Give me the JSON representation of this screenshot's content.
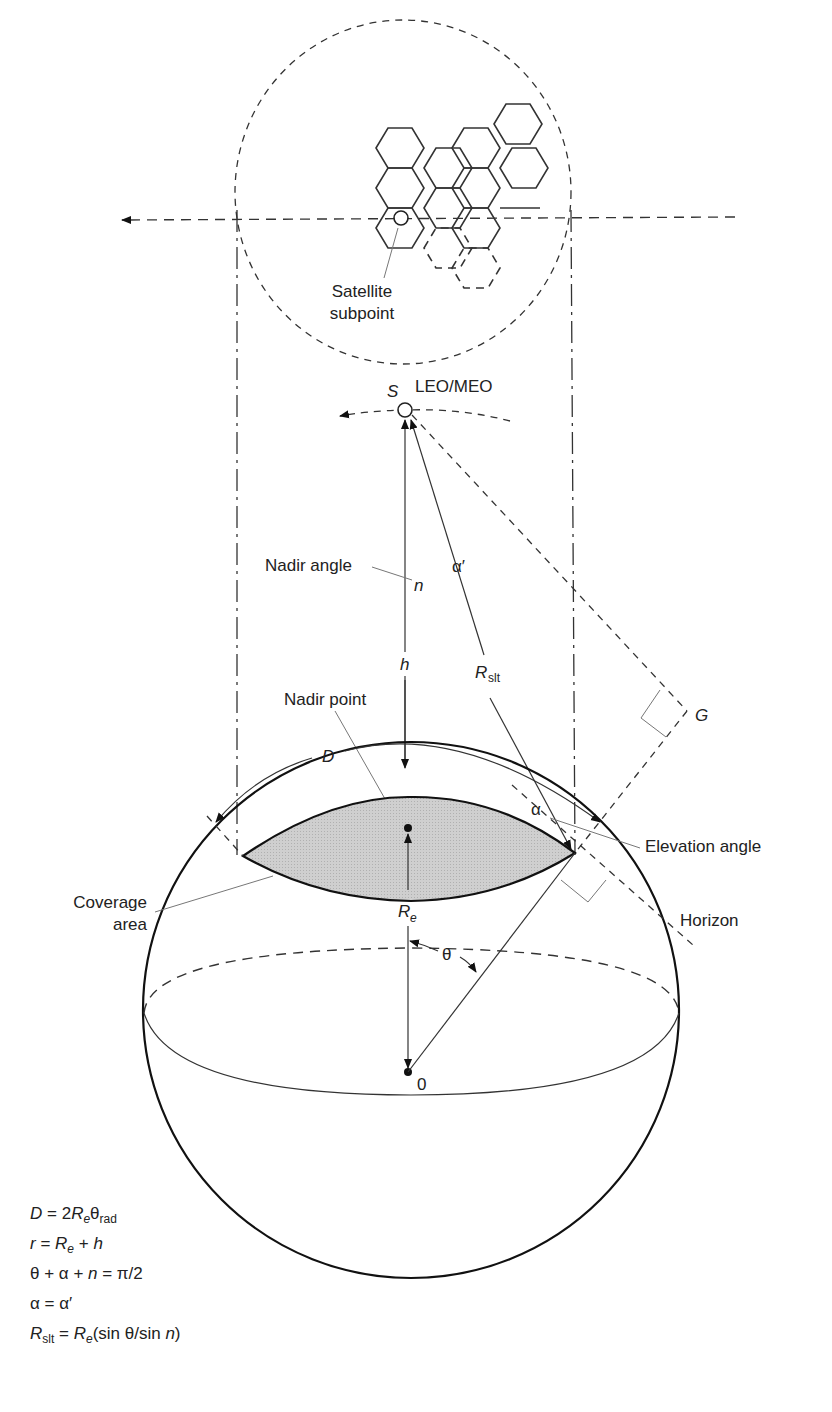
{
  "labels": {
    "satellite_subpoint_1": "Satellite",
    "satellite_subpoint_2": "subpoint",
    "satellite_symbol": "S",
    "orbit_type": "LEO/MEO",
    "nadir_angle": "Nadir angle",
    "nadir_angle_symbol": "n",
    "alpha_prime": "α′",
    "height_symbol": "h",
    "slant_range_R": "R",
    "slant_range_sub": "slt",
    "nadir_point": "Nadir point",
    "G": "G",
    "D": "D",
    "alpha": "α",
    "elevation_angle": "Elevation angle",
    "coverage_area_1": "Coverage",
    "coverage_area_2": "area",
    "earth_radius_R": "R",
    "earth_radius_sub": "e",
    "horizon": "Horizon",
    "theta": "θ",
    "center": "0"
  },
  "equations": [
    "D = 2R_e θ_rad",
    "r = R_e + h",
    "θ + α + n = π/2",
    "α = α′",
    "R_slt = R_e(sin θ/sin n)"
  ],
  "colors": {
    "coverage_fill": "#c8c8c8",
    "line": "#222222",
    "background": "#ffffff"
  }
}
